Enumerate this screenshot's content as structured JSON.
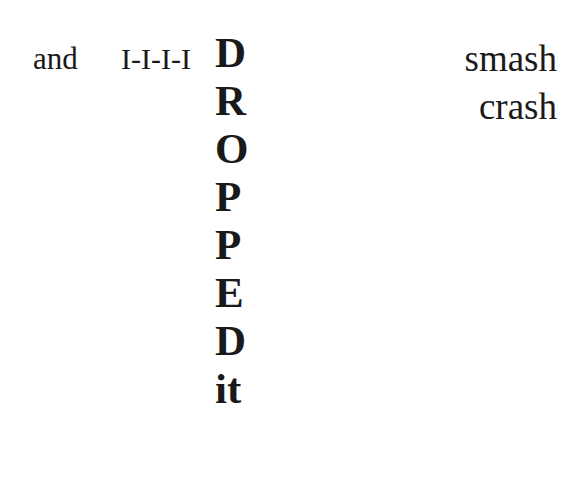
{
  "poem": {
    "left_word": "and",
    "stutter": "I-I-I-I",
    "stacked_letters": [
      "D",
      "R",
      "O",
      "P",
      "P",
      "E",
      "D",
      "it"
    ],
    "right_words": [
      "smash",
      "crash"
    ]
  }
}
